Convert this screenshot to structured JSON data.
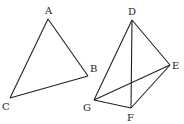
{
  "diagram": {
    "figures": [
      {
        "name": "triangle-ABC",
        "points": {
          "A": {
            "x": 48,
            "y": 19,
            "lx": 45,
            "ly": 14
          },
          "B": {
            "x": 88,
            "y": 76,
            "lx": 90,
            "ly": 72
          },
          "C": {
            "x": 10,
            "y": 98,
            "lx": 2,
            "ly": 110
          }
        },
        "edges": [
          [
            "A",
            "B"
          ],
          [
            "B",
            "C"
          ],
          [
            "C",
            "A"
          ]
        ]
      },
      {
        "name": "tetrahedron-DEFG",
        "points": {
          "D": {
            "x": 132,
            "y": 20,
            "lx": 128,
            "ly": 15
          },
          "E": {
            "x": 170,
            "y": 65,
            "lx": 172,
            "ly": 69
          },
          "F": {
            "x": 131,
            "y": 108,
            "lx": 127,
            "ly": 121
          },
          "G": {
            "x": 94,
            "y": 100,
            "lx": 83,
            "ly": 111
          }
        },
        "edges": [
          [
            "D",
            "E"
          ],
          [
            "D",
            "F"
          ],
          [
            "D",
            "G"
          ],
          [
            "E",
            "F"
          ],
          [
            "E",
            "G"
          ],
          [
            "G",
            "F"
          ]
        ]
      }
    ],
    "labels": [
      "A",
      "B",
      "C",
      "D",
      "E",
      "F",
      "G"
    ]
  }
}
